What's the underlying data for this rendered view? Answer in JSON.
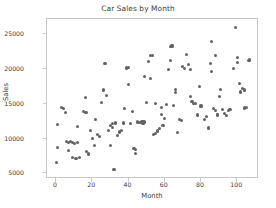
{
  "chart_data": {
    "type": "scatter",
    "title": "Car Sales by Month",
    "xlabel": "Month",
    "ylabel": "Sales",
    "xlim": [
      -5,
      112
    ],
    "ylim": [
      4200,
      27200
    ],
    "grid": false,
    "legend": null,
    "marker_color": "#636363",
    "spine_color": "#c9c9c9",
    "text_color": "#3a3a3a",
    "xticks": [
      0,
      20,
      40,
      60,
      80,
      100
    ],
    "xtick_labels": [
      "0",
      "20",
      "40",
      "60",
      "80",
      "100"
    ],
    "yticks": [
      5000,
      10000,
      15000,
      20000,
      25000
    ],
    "ytick_labels": [
      "5000",
      "10000",
      "15000",
      "20000",
      "25000"
    ],
    "points": [
      [
        0,
        6550
      ],
      [
        1,
        8750
      ],
      [
        1,
        12000
      ],
      [
        3,
        14450
      ],
      [
        4,
        14300
      ],
      [
        5,
        13800
      ],
      [
        6,
        9600
      ],
      [
        7,
        9500
      ],
      [
        7,
        8350
      ],
      [
        8,
        9600
      ],
      [
        9,
        9450
      ],
      [
        9,
        7350
      ],
      [
        10,
        9300
      ],
      [
        11,
        7200
      ],
      [
        12,
        9400
      ],
      [
        12,
        11800
      ],
      [
        13,
        7250
      ],
      [
        15,
        13900
      ],
      [
        16,
        13800
      ],
      [
        16,
        15900
      ],
      [
        17,
        13800
      ],
      [
        17,
        8100
      ],
      [
        18,
        7900
      ],
      [
        18,
        7750
      ],
      [
        19,
        11150
      ],
      [
        20,
        10000
      ],
      [
        21,
        9000
      ],
      [
        22,
        12700
      ],
      [
        23,
        10600
      ],
      [
        24,
        10300
      ],
      [
        25,
        15150
      ],
      [
        26,
        17000
      ],
      [
        27,
        20800
      ],
      [
        28,
        16150
      ],
      [
        29,
        11150
      ],
      [
        30,
        9000
      ],
      [
        30,
        11900
      ],
      [
        31,
        12200
      ],
      [
        31,
        11600
      ],
      [
        32,
        5600
      ],
      [
        33,
        12250
      ],
      [
        34,
        10500
      ],
      [
        35,
        10950
      ],
      [
        36,
        11200
      ],
      [
        37,
        12250
      ],
      [
        38,
        14350
      ],
      [
        39,
        20150
      ],
      [
        40,
        20200
      ],
      [
        40,
        17800
      ],
      [
        41,
        12200
      ],
      [
        42,
        13900
      ],
      [
        43,
        8600
      ],
      [
        44,
        8500
      ],
      [
        44,
        7900
      ],
      [
        45,
        12400
      ],
      [
        46,
        12350
      ],
      [
        47,
        12400
      ],
      [
        48,
        12200
      ],
      [
        48,
        12450
      ],
      [
        49,
        12400
      ],
      [
        49,
        18900
      ],
      [
        50,
        15150
      ],
      [
        51,
        21050
      ],
      [
        52,
        22000
      ],
      [
        52,
        18600
      ],
      [
        53,
        22000
      ],
      [
        54,
        10600
      ],
      [
        55,
        10800
      ],
      [
        55,
        15100
      ],
      [
        56,
        11100
      ],
      [
        57,
        11400
      ],
      [
        58,
        14450
      ],
      [
        58,
        13500
      ],
      [
        59,
        11900
      ],
      [
        60,
        12900
      ],
      [
        61,
        14900
      ],
      [
        62,
        20000
      ],
      [
        63,
        21200
      ],
      [
        63,
        23250
      ],
      [
        64,
        23400
      ],
      [
        64,
        23250
      ],
      [
        65,
        14800
      ],
      [
        66,
        17100
      ],
      [
        66,
        16600
      ],
      [
        67,
        10900
      ],
      [
        68,
        12700
      ],
      [
        69,
        12600
      ],
      [
        70,
        20400
      ],
      [
        71,
        20100
      ],
      [
        72,
        22050
      ],
      [
        73,
        20650
      ],
      [
        74,
        16000
      ],
      [
        74,
        20000
      ],
      [
        75,
        15400
      ],
      [
        76,
        15100
      ],
      [
        77,
        15000
      ],
      [
        78,
        13400
      ],
      [
        79,
        17500
      ],
      [
        80,
        14700
      ],
      [
        82,
        12800
      ],
      [
        83,
        13200
      ],
      [
        84,
        11650
      ],
      [
        84,
        11500
      ],
      [
        85,
        20800
      ],
      [
        86,
        24000
      ],
      [
        86,
        19700
      ],
      [
        87,
        14300
      ],
      [
        88,
        22000
      ],
      [
        88,
        14100
      ],
      [
        89,
        13500
      ],
      [
        89,
        13400
      ],
      [
        90,
        16100
      ],
      [
        91,
        17100
      ],
      [
        92,
        14200
      ],
      [
        93,
        13600
      ],
      [
        94,
        13300
      ],
      [
        95,
        14100
      ],
      [
        96,
        14150
      ],
      [
        98,
        20100
      ],
      [
        99,
        26000
      ],
      [
        100,
        21700
      ],
      [
        100,
        21000
      ],
      [
        101,
        17900
      ],
      [
        102,
        16700
      ],
      [
        103,
        17200
      ],
      [
        104,
        17000
      ],
      [
        104,
        14400
      ],
      [
        105,
        14450
      ],
      [
        106,
        21200
      ],
      [
        107,
        21300
      ]
    ]
  }
}
